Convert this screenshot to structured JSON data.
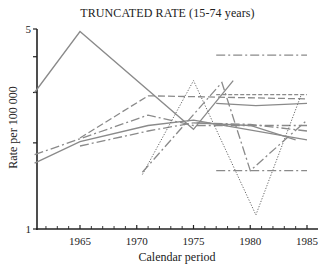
{
  "chart_data": {
    "type": "line",
    "title": "TRUNCATED RATE (15-74 years)",
    "xlabel": "Calendar period",
    "ylabel": "Rate per 100 000",
    "yscale": "log",
    "xlim": [
      1961,
      1986
    ],
    "ylim": [
      1,
      5
    ],
    "x_ticks": [
      1965,
      1970,
      1975,
      1980,
      1985
    ],
    "y_ticks": [
      1,
      2,
      3,
      4,
      5
    ],
    "y_tick_labels": [
      "1",
      "",
      "",
      "",
      "5"
    ],
    "grid": false,
    "legend": "none",
    "series": [
      {
        "name": "series-1",
        "style": "solid",
        "x": [
          1961,
          1965,
          1975,
          1978.5
        ],
        "values": [
          3.0,
          4.9,
          2.23,
          3.3
        ]
      },
      {
        "name": "series-2",
        "style": "longdash",
        "x": [
          1965,
          1971,
          1985
        ],
        "values": [
          2.08,
          2.92,
          2.85
        ]
      },
      {
        "name": "series-3",
        "style": "dashdot",
        "x": [
          1961,
          1971,
          1975,
          1985
        ],
        "values": [
          1.82,
          2.5,
          2.3,
          2.3
        ]
      },
      {
        "name": "series-4",
        "style": "solid",
        "x": [
          1961,
          1965,
          1971,
          1975,
          1985
        ],
        "values": [
          1.7,
          2.02,
          2.3,
          2.4,
          2.05
        ]
      },
      {
        "name": "series-5",
        "style": "dashdot",
        "x": [
          1965,
          1971,
          1975,
          1980,
          1985
        ],
        "values": [
          1.95,
          2.2,
          2.35,
          2.32,
          2.2
        ]
      },
      {
        "name": "series-6",
        "style": "dotted",
        "x": [
          1970.5,
          1975,
          1980.5,
          1984.5
        ],
        "values": [
          1.55,
          3.3,
          1.12,
          2.95
        ]
      },
      {
        "name": "series-7",
        "style": "dashdot",
        "x": [
          1970.5,
          1977.5,
          1980,
          1985
        ],
        "values": [
          1.58,
          3.25,
          1.6,
          2.4
        ]
      },
      {
        "name": "series-8",
        "style": "dashdot",
        "x": [
          1977,
          1985
        ],
        "values": [
          4.05,
          4.05
        ]
      },
      {
        "name": "series-9",
        "style": "dashdot",
        "x": [
          1977,
          1985
        ],
        "values": [
          1.6,
          1.6
        ]
      },
      {
        "name": "series-10",
        "style": "solid",
        "x": [
          1977,
          1980.5,
          1985
        ],
        "values": [
          2.75,
          2.7,
          2.75
        ]
      },
      {
        "name": "series-11",
        "style": "dashed",
        "x": [
          1977,
          1985
        ],
        "values": [
          2.95,
          2.95
        ]
      },
      {
        "name": "series-12",
        "style": "solid",
        "x": [
          1975,
          1980,
          1984
        ],
        "values": [
          2.35,
          2.3,
          2.05
        ]
      }
    ]
  },
  "labels": {
    "title": "TRUNCATED RATE (15-74 years)",
    "xlabel": "Calendar period",
    "ylabel": "Rate per 100 000"
  }
}
